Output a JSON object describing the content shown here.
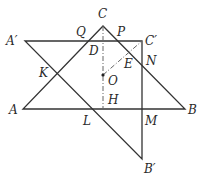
{
  "diagram": {
    "type": "geometry",
    "colors": {
      "line": "#333333",
      "dashed": "#555555"
    },
    "points": {
      "A": {
        "label": "A",
        "x": 23,
        "y": 109
      },
      "B": {
        "label": "B",
        "x": 185,
        "y": 109
      },
      "C": {
        "label": "C",
        "x": 103,
        "y": 26
      },
      "A_prime": {
        "label": "A′",
        "x": 25,
        "y": 41
      },
      "B_prime": {
        "label": "B′",
        "x": 142,
        "y": 159
      },
      "C_prime": {
        "label": "C′",
        "x": 142,
        "y": 41
      },
      "O": {
        "label": "O",
        "x": 103,
        "y": 75
      },
      "D": {
        "label": "D",
        "x": 103,
        "y": 41
      },
      "H": {
        "label": "H",
        "x": 103,
        "y": 109
      },
      "E": {
        "label": "E",
        "x": 128,
        "y": 57
      },
      "P": {
        "label": "P",
        "x": 118,
        "y": 41
      },
      "Q": {
        "label": "Q",
        "x": 88,
        "y": 41
      },
      "N": {
        "label": "N",
        "x": 142,
        "y": 65
      },
      "K": {
        "label": "K",
        "x": 57,
        "y": 73
      },
      "L": {
        "label": "L",
        "x": 92,
        "y": 109
      },
      "M": {
        "label": "M",
        "x": 142,
        "y": 109
      }
    },
    "segments_solid": [
      "AB",
      "BC",
      "CA",
      "A'C'",
      "C'B'",
      "B'A'"
    ],
    "segments_dashed": [
      "CH",
      "OC'"
    ]
  }
}
